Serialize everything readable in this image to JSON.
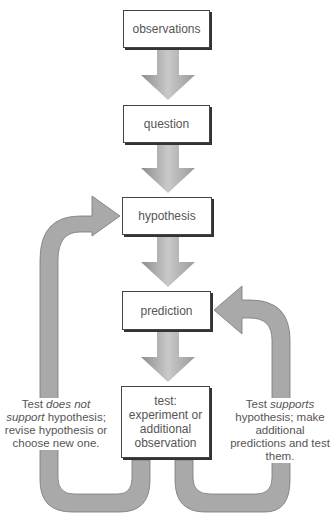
{
  "diagram": {
    "nodes": [
      {
        "id": "observations",
        "label": "observations"
      },
      {
        "id": "question",
        "label": "question"
      },
      {
        "id": "hypothesis",
        "label": "hypothesis"
      },
      {
        "id": "prediction",
        "label": "prediction"
      },
      {
        "id": "test",
        "label": "test: experiment or additional observation"
      }
    ],
    "edges": [
      {
        "from": "observations",
        "to": "question"
      },
      {
        "from": "question",
        "to": "hypothesis"
      },
      {
        "from": "hypothesis",
        "to": "prediction"
      },
      {
        "from": "prediction",
        "to": "test"
      },
      {
        "from": "test",
        "to": "hypothesis",
        "label": "Test does not support hypothesis; revise hypothesis or choose new one."
      },
      {
        "from": "test",
        "to": "prediction",
        "label": "Test supports hypothesis; make additional predictions and test them."
      }
    ]
  },
  "boxes": {
    "observations": "observations",
    "question": "question",
    "hypothesis": "hypothesis",
    "prediction": "prediction",
    "test_line1": "test:",
    "test_line2": "experiment or",
    "test_line3": "additional",
    "test_line4": "observation"
  },
  "notes": {
    "left_pre": "Test ",
    "left_em": "does not support",
    "left_post": "hypothesis; revise hypothesis or choose new one.",
    "right_pre": "Test ",
    "right_em": "supports",
    "right_post": "hypothesis; make additional predictions and test them."
  },
  "colors": {
    "arrow": "#a9a9a9",
    "border": "#444444",
    "text": "#555555"
  }
}
